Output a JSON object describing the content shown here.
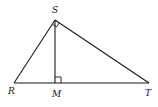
{
  "diagram": {
    "title": "",
    "type": "right-triangle-with-altitude",
    "stroke_color": "#1a1a1a",
    "points": {
      "S": {
        "label": "S",
        "x": 55,
        "y": 20
      },
      "R": {
        "label": "R",
        "x": 14,
        "y": 83
      },
      "M": {
        "label": "M",
        "x": 55,
        "y": 83
      },
      "T": {
        "label": "T",
        "x": 149,
        "y": 83
      }
    },
    "segments": [
      {
        "from": "R",
        "to": "S"
      },
      {
        "from": "S",
        "to": "T"
      },
      {
        "from": "R",
        "to": "T"
      },
      {
        "from": "S",
        "to": "M"
      }
    ],
    "right_angles": [
      {
        "at": "S",
        "between": [
          "R",
          "T"
        ]
      },
      {
        "at": "M",
        "between": [
          "S",
          "T"
        ]
      }
    ],
    "labels": {
      "S": "S",
      "R": "R",
      "M": "M",
      "T": "T"
    }
  }
}
